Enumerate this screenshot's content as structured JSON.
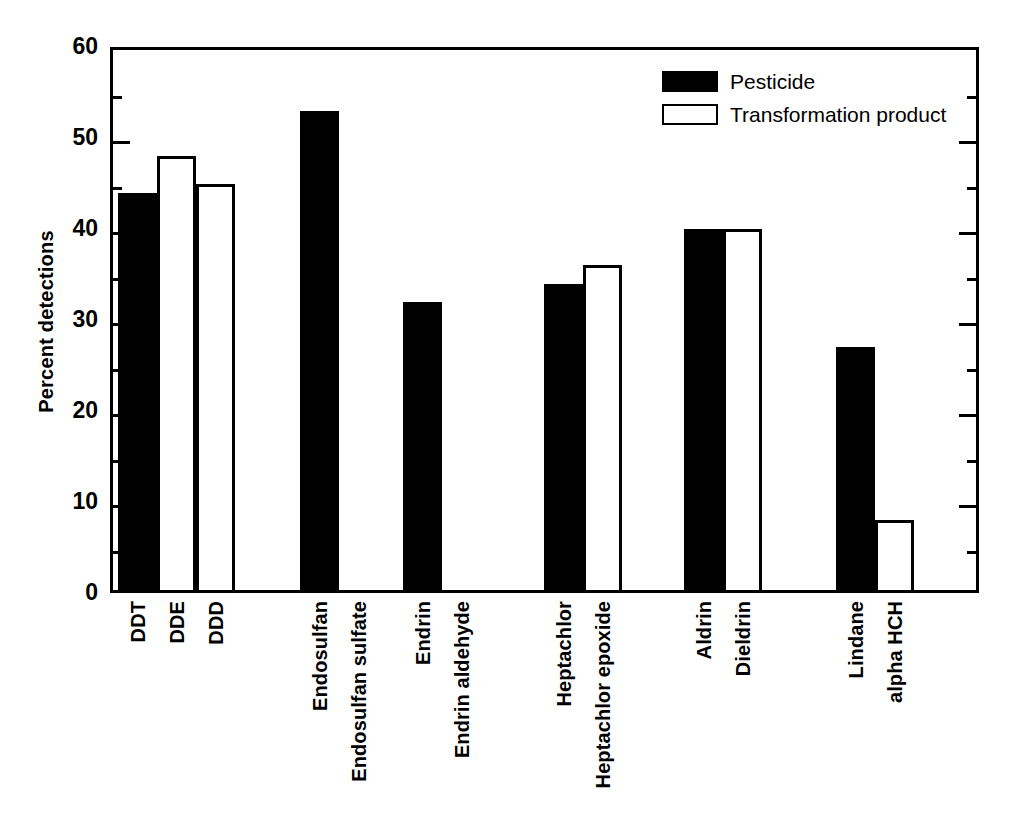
{
  "chart_data": {
    "type": "bar",
    "title": "",
    "subtitle": "",
    "xlabel": "",
    "ylabel": "Percent detections",
    "ylim": [
      0,
      60
    ],
    "y_major_ticks": [
      0,
      10,
      20,
      30,
      40,
      50,
      60
    ],
    "y_minor_ticks": [
      5,
      15,
      25,
      35,
      45,
      55
    ],
    "y_tick_labels": [
      "0",
      "10",
      "20",
      "30",
      "40",
      "50",
      "60"
    ],
    "grid": false,
    "legend_position": "top-right",
    "legend": [
      {
        "name": "Pesticide",
        "style": "filled",
        "color": "#000000"
      },
      {
        "name": "Transformation product",
        "style": "open",
        "color": "#ffffff"
      }
    ],
    "categories": [
      "DDT",
      "DDE",
      "DDD",
      "Endosulfan",
      "Endosulfan sulfate",
      "Endrin",
      "Endrin aldehyde",
      "Heptachlor",
      "Heptachlor epoxide",
      "Aldrin",
      "Dieldrin",
      "Lindane",
      "alpha HCH"
    ],
    "values": [
      44,
      48,
      45,
      53,
      0,
      32,
      0,
      34,
      36,
      40,
      40,
      27,
      8
    ],
    "series_of_bar": [
      "Pesticide",
      "Transformation product",
      "Transformation product",
      "Pesticide",
      "Transformation product",
      "Pesticide",
      "Transformation product",
      "Pesticide",
      "Transformation product",
      "Pesticide",
      "Transformation product",
      "Pesticide",
      "Transformation product"
    ],
    "bars": [
      {
        "label": "DDT",
        "value": 44,
        "series": "Pesticide",
        "style": "filled",
        "group": 1
      },
      {
        "label": "DDE",
        "value": 48,
        "series": "Transformation product",
        "style": "open",
        "group": 1
      },
      {
        "label": "DDD",
        "value": 45,
        "series": "Transformation product",
        "style": "open",
        "group": 1
      },
      {
        "label": "Endosulfan",
        "value": 53,
        "series": "Pesticide",
        "style": "filled",
        "group": 2
      },
      {
        "label": "Endosulfan sulfate",
        "value": 0,
        "series": "Transformation product",
        "style": "open",
        "group": 2
      },
      {
        "label": "Endrin",
        "value": 32,
        "series": "Pesticide",
        "style": "filled",
        "group": 3
      },
      {
        "label": "Endrin aldehyde",
        "value": 0,
        "series": "Transformation product",
        "style": "open",
        "group": 3
      },
      {
        "label": "Heptachlor",
        "value": 34,
        "series": "Pesticide",
        "style": "filled",
        "group": 4
      },
      {
        "label": "Heptachlor epoxide",
        "value": 36,
        "series": "Transformation product",
        "style": "open",
        "group": 4
      },
      {
        "label": "Aldrin",
        "value": 40,
        "series": "Pesticide",
        "style": "filled",
        "group": 5
      },
      {
        "label": "Dieldrin",
        "value": 40,
        "series": "Transformation product",
        "style": "open",
        "group": 5
      },
      {
        "label": "Lindane",
        "value": 27,
        "series": "Pesticide",
        "style": "filled",
        "group": 6
      },
      {
        "label": "alpha HCH",
        "value": 8,
        "series": "Transformation product",
        "style": "open",
        "group": 6
      }
    ],
    "colors": {
      "pesticide": "#000000",
      "transformation_product": "#ffffff",
      "axis": "#000000",
      "background": "#ffffff"
    }
  }
}
